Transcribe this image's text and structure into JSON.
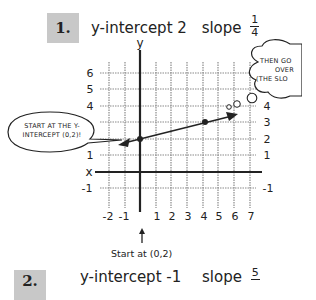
{
  "problems": [
    {
      "number": "1.",
      "title_prefix": "y-intercept 2",
      "slope_label": "slope",
      "slope_numerator": "1",
      "slope_denominator": "4"
    },
    {
      "number": "2.",
      "title_prefix": "y-intercept -1",
      "slope_label": "slope",
      "slope_numerator": "5",
      "slope_denominator": ""
    }
  ],
  "graph": {
    "y_axis_label": "y",
    "x_axis_label": "x",
    "x_tick_labels": [
      "-2",
      "-1",
      "1",
      "2",
      "3",
      "4",
      "5",
      "6",
      "7"
    ],
    "y_tick_labels_left": [
      "6",
      "5",
      "4",
      "1",
      "-1"
    ],
    "y_tick_labels_right": [
      "4",
      "3",
      "2",
      "1",
      "-1"
    ],
    "points": [
      {
        "label": "y-intercept",
        "x": 0,
        "y": 2
      },
      {
        "label": "slope point",
        "x": 4,
        "y": 3
      }
    ]
  },
  "callouts": {
    "left_bubble_line1": "START AT THE Y-",
    "left_bubble_line2": "INTERCEPT (0,2)!",
    "right_bubble_line1": "THEN GO",
    "right_bubble_line2": "OVER",
    "right_bubble_line3": "(THE SLO"
  },
  "caption": "Start at (0,2)",
  "colors": {
    "ink": "#222222",
    "grid": "#8a8a8a",
    "number_box": "#c8c8c8"
  }
}
